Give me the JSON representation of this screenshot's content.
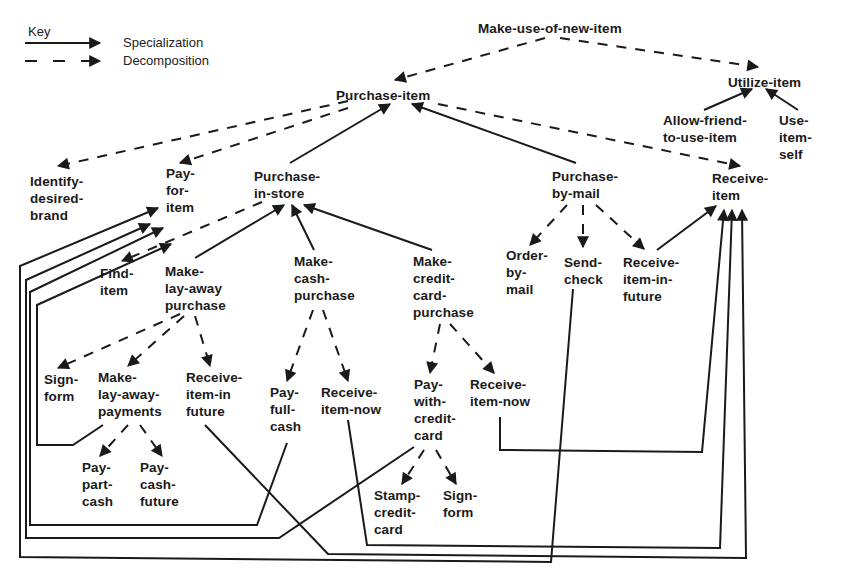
{
  "key": {
    "title": "Key",
    "items": [
      {
        "label": "Specialization",
        "style": "solid"
      },
      {
        "label": "Decomposition",
        "style": "dashed"
      }
    ]
  },
  "colors": {
    "ink": "#1a1a1a",
    "background": "#ffffff"
  },
  "nodes": [
    {
      "id": "make-use-of-new-item",
      "label": "Make-use-of-new-item",
      "x": 478,
      "y": 20
    },
    {
      "id": "purchase-item",
      "label": "Purchase-item",
      "x": 336,
      "y": 87
    },
    {
      "id": "utilize-item",
      "label": "Utilize-item",
      "x": 728,
      "y": 74
    },
    {
      "id": "allow-friend-to-use-item",
      "label": "Allow-friend-\nto-use-item",
      "x": 663,
      "y": 112
    },
    {
      "id": "use-item-self",
      "label": "Use-\nitem-\nself",
      "x": 779,
      "y": 112
    },
    {
      "id": "identify-desired-brand",
      "label": "Identify-\ndesired-\nbrand",
      "x": 30,
      "y": 173
    },
    {
      "id": "pay-for-item",
      "label": "Pay-\nfor-\nitem",
      "x": 166,
      "y": 165
    },
    {
      "id": "purchase-in-store",
      "label": "Purchase-\nin-store",
      "x": 254,
      "y": 168
    },
    {
      "id": "purchase-by-mail",
      "label": "Purchase-\nby-mail",
      "x": 552,
      "y": 168
    },
    {
      "id": "receive-item",
      "label": "Receive-\nitem",
      "x": 712,
      "y": 170
    },
    {
      "id": "find-item",
      "label": "Find-\nitem",
      "x": 100,
      "y": 265
    },
    {
      "id": "make-lay-away-purchase",
      "label": "Make-\nlay-away\npurchase",
      "x": 165,
      "y": 263
    },
    {
      "id": "make-cash-purchase",
      "label": "Make-\ncash-\npurchase",
      "x": 294,
      "y": 253
    },
    {
      "id": "make-credit-card-purchase",
      "label": "Make-\ncredit-\ncard-\npurchase",
      "x": 413,
      "y": 253
    },
    {
      "id": "order-by-mail",
      "label": "Order-\nby-\nmail",
      "x": 506,
      "y": 247
    },
    {
      "id": "send-check",
      "label": "Send-\ncheck",
      "x": 564,
      "y": 254
    },
    {
      "id": "receive-item-in-future-mail",
      "label": "Receive-\nitem-in-\nfuture",
      "x": 623,
      "y": 254
    },
    {
      "id": "sign-form-layaway",
      "label": "Sign-\nform",
      "x": 44,
      "y": 371
    },
    {
      "id": "make-lay-away-payments",
      "label": "Make-\nlay-away-\npayments",
      "x": 98,
      "y": 369
    },
    {
      "id": "receive-item-in-future-layaway",
      "label": "Receive-\nitem-in\nfuture",
      "x": 186,
      "y": 369
    },
    {
      "id": "pay-full-cash",
      "label": "Pay-\nfull-\ncash",
      "x": 270,
      "y": 384
    },
    {
      "id": "receive-item-now-cash",
      "label": "Receive-\nitem-now",
      "x": 321,
      "y": 384
    },
    {
      "id": "pay-with-credit-card",
      "label": "Pay-\nwith-\ncredit-\ncard",
      "x": 414,
      "y": 376
    },
    {
      "id": "receive-item-now-credit",
      "label": "Receive-\nitem-now",
      "x": 470,
      "y": 376
    },
    {
      "id": "pay-part-cash",
      "label": "Pay-\npart-\ncash",
      "x": 82,
      "y": 459
    },
    {
      "id": "pay-cash-future",
      "label": "Pay-\ncash-\nfuture",
      "x": 140,
      "y": 459
    },
    {
      "id": "stamp-credit-card",
      "label": "Stamp-\ncredit-\ncard",
      "x": 374,
      "y": 487
    },
    {
      "id": "sign-form-credit",
      "label": "Sign-\nform",
      "x": 443,
      "y": 487
    }
  ],
  "edges": [
    {
      "from": "make-use-of-new-item",
      "to": "purchase-item",
      "type": "decomposition",
      "points": [
        [
          545,
          38
        ],
        [
          395,
          80
        ]
      ]
    },
    {
      "from": "make-use-of-new-item",
      "to": "utilize-item",
      "type": "decomposition",
      "points": [
        [
          560,
          38
        ],
        [
          758,
          67
        ]
      ]
    },
    {
      "from": "allow-friend-to-use-item",
      "to": "utilize-item",
      "type": "specialization",
      "points": [
        [
          704,
          110
        ],
        [
          752,
          89
        ]
      ]
    },
    {
      "from": "use-item-self",
      "to": "utilize-item",
      "type": "specialization",
      "points": [
        [
          798,
          110
        ],
        [
          766,
          89
        ]
      ]
    },
    {
      "from": "purchase-item",
      "to": "identify-desired-brand",
      "type": "decomposition",
      "points": [
        [
          348,
          101
        ],
        [
          58,
          166
        ]
      ]
    },
    {
      "from": "purchase-item",
      "to": "pay-for-item",
      "type": "decomposition",
      "points": [
        [
          348,
          108
        ],
        [
          180,
          163
        ]
      ]
    },
    {
      "from": "purchase-in-store",
      "to": "purchase-item",
      "type": "specialization",
      "points": [
        [
          290,
          163
        ],
        [
          390,
          104
        ]
      ]
    },
    {
      "from": "purchase-by-mail",
      "to": "purchase-item",
      "type": "specialization",
      "points": [
        [
          576,
          163
        ],
        [
          412,
          104
        ]
      ]
    },
    {
      "from": "purchase-item",
      "to": "receive-item",
      "type": "decomposition",
      "points": [
        [
          438,
          104
        ],
        [
          740,
          166
        ]
      ]
    },
    {
      "from": "purchase-in-store",
      "to": "find-item",
      "type": "decomposition",
      "points": [
        [
          262,
          202
        ],
        [
          122,
          261
        ]
      ]
    },
    {
      "from": "make-lay-away-purchase",
      "to": "purchase-in-store",
      "type": "specialization",
      "points": [
        [
          195,
          258
        ],
        [
          284,
          205
        ]
      ]
    },
    {
      "from": "make-cash-purchase",
      "to": "purchase-in-store",
      "type": "specialization",
      "points": [
        [
          314,
          250
        ],
        [
          292,
          205
        ]
      ]
    },
    {
      "from": "make-credit-card-purchase",
      "to": "purchase-in-store",
      "type": "specialization",
      "points": [
        [
          432,
          250
        ],
        [
          304,
          205
        ]
      ]
    },
    {
      "from": "purchase-by-mail",
      "to": "order-by-mail",
      "type": "decomposition",
      "points": [
        [
          567,
          205
        ],
        [
          530,
          245
        ]
      ]
    },
    {
      "from": "purchase-by-mail",
      "to": "send-check",
      "type": "decomposition",
      "points": [
        [
          583,
          205
        ],
        [
          583,
          247
        ]
      ]
    },
    {
      "from": "purchase-by-mail",
      "to": "receive-item-in-future-mail",
      "type": "decomposition",
      "points": [
        [
          596,
          205
        ],
        [
          644,
          249
        ]
      ]
    },
    {
      "from": "receive-item-in-future-mail",
      "to": "receive-item",
      "type": "specialization",
      "points": [
        [
          657,
          250
        ],
        [
          716,
          206
        ]
      ]
    },
    {
      "from": "make-lay-away-purchase",
      "to": "sign-form-layaway",
      "type": "decomposition",
      "points": [
        [
          180,
          314
        ],
        [
          58,
          368
        ]
      ]
    },
    {
      "from": "make-lay-away-purchase",
      "to": "make-lay-away-payments",
      "type": "decomposition",
      "points": [
        [
          184,
          316
        ],
        [
          128,
          366
        ]
      ]
    },
    {
      "from": "make-lay-away-purchase",
      "to": "receive-item-in-future-layaway",
      "type": "decomposition",
      "points": [
        [
          195,
          316
        ],
        [
          210,
          366
        ]
      ]
    },
    {
      "from": "make-cash-purchase",
      "to": "pay-full-cash",
      "type": "decomposition",
      "points": [
        [
          313,
          310
        ],
        [
          287,
          381
        ]
      ]
    },
    {
      "from": "make-cash-purchase",
      "to": "receive-item-now-cash",
      "type": "decomposition",
      "points": [
        [
          323,
          310
        ],
        [
          348,
          381
        ]
      ]
    },
    {
      "from": "make-credit-card-purchase",
      "to": "pay-with-credit-card",
      "type": "decomposition",
      "points": [
        [
          440,
          324
        ],
        [
          430,
          373
        ]
      ]
    },
    {
      "from": "make-credit-card-purchase",
      "to": "receive-item-now-credit",
      "type": "decomposition",
      "points": [
        [
          450,
          324
        ],
        [
          494,
          373
        ]
      ]
    },
    {
      "from": "make-lay-away-payments",
      "to": "pay-part-cash",
      "type": "decomposition",
      "points": [
        [
          128,
          425
        ],
        [
          100,
          456
        ]
      ]
    },
    {
      "from": "make-lay-away-payments",
      "to": "pay-cash-future",
      "type": "decomposition",
      "points": [
        [
          140,
          425
        ],
        [
          162,
          456
        ]
      ]
    },
    {
      "from": "pay-with-credit-card",
      "to": "stamp-credit-card",
      "type": "decomposition",
      "points": [
        [
          424,
          450
        ],
        [
          402,
          484
        ]
      ]
    },
    {
      "from": "pay-with-credit-card",
      "to": "sign-form-credit",
      "type": "decomposition",
      "points": [
        [
          436,
          450
        ],
        [
          456,
          484
        ]
      ]
    },
    {
      "from": "make-lay-away-payments",
      "to": "pay-for-item",
      "type": "specialization",
      "points": [
        [
          103,
          425
        ],
        [
          73,
          445
        ],
        [
          37,
          445
        ],
        [
          37,
          305
        ],
        [
          171,
          244
        ]
      ]
    },
    {
      "from": "pay-full-cash",
      "to": "pay-for-item",
      "type": "specialization",
      "points": [
        [
          287,
          443
        ],
        [
          257,
          525
        ],
        [
          30,
          525
        ],
        [
          30,
          292
        ],
        [
          163,
          228
        ]
      ]
    },
    {
      "from": "pay-with-credit-card",
      "to": "pay-for-item",
      "type": "specialization",
      "points": [
        [
          414,
          447
        ],
        [
          279,
          538
        ],
        [
          26,
          538
        ],
        [
          26,
          280
        ],
        [
          150,
          224
        ]
      ]
    },
    {
      "from": "send-check",
      "to": "pay-for-item",
      "type": "specialization",
      "points": [
        [
          573,
          289
        ],
        [
          551,
          562
        ],
        [
          20,
          557
        ],
        [
          20,
          266
        ],
        [
          158,
          208
        ]
      ]
    },
    {
      "from": "receive-item-now-credit",
      "to": "receive-item",
      "type": "specialization",
      "points": [
        [
          500,
          417
        ],
        [
          500,
          450
        ],
        [
          702,
          452
        ],
        [
          724,
          210
        ]
      ]
    },
    {
      "from": "receive-item-now-cash",
      "to": "receive-item",
      "type": "specialization",
      "points": [
        [
          348,
          420
        ],
        [
          367,
          545
        ],
        [
          720,
          548
        ],
        [
          732,
          210
        ]
      ]
    },
    {
      "from": "receive-item-in-future-layaway",
      "to": "receive-item",
      "type": "specialization",
      "points": [
        [
          205,
          425
        ],
        [
          328,
          554
        ],
        [
          746,
          558
        ],
        [
          742,
          210
        ]
      ]
    }
  ]
}
